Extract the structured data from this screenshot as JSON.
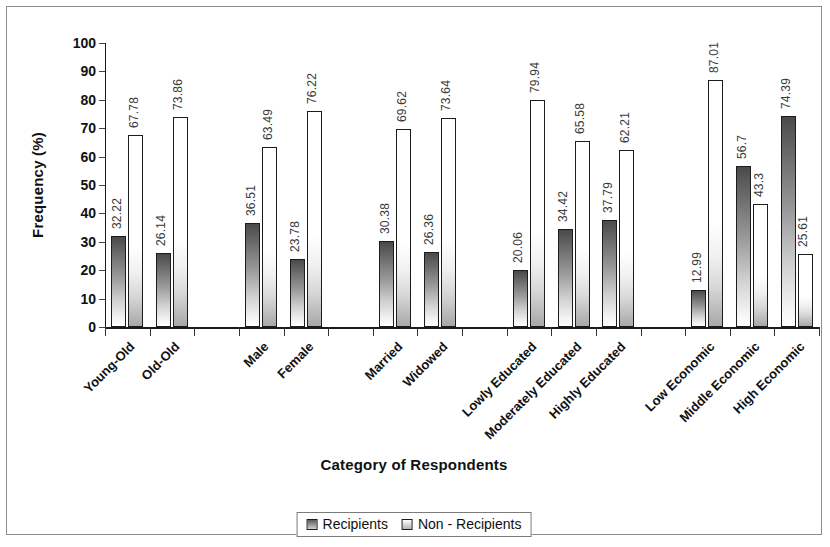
{
  "chart_data": {
    "type": "bar",
    "title": "",
    "xlabel": "Category of Respondents",
    "ylabel": "Frequency (%)",
    "ylim": [
      0,
      100
    ],
    "yticks": [
      0,
      10,
      20,
      30,
      40,
      50,
      60,
      70,
      80,
      90,
      100
    ],
    "grid": false,
    "legend_position": "bottom-center",
    "categories": [
      "Young-Old",
      "Old-Old",
      "",
      "Male",
      "Female",
      "",
      "Married",
      "Widowed",
      "",
      "Lowly Educated",
      "Moderately Educated",
      "Highly Educated",
      "",
      "Low Economic",
      "Middle Economic",
      "High Economic"
    ],
    "series": [
      {
        "name": "Recipients",
        "values": [
          32.22,
          26.14,
          null,
          36.51,
          23.78,
          null,
          30.38,
          26.36,
          null,
          20.06,
          34.42,
          37.79,
          null,
          12.99,
          56.7,
          74.39
        ],
        "labels": [
          "32.22",
          "26.14",
          "",
          "36.51",
          "23.78",
          "",
          "30.38",
          "26.36",
          "",
          "20.06",
          "34.42",
          "37.79",
          "",
          "12.99",
          "56.7",
          "74.39"
        ]
      },
      {
        "name": "Non - Recipients",
        "values": [
          67.78,
          73.86,
          null,
          63.49,
          76.22,
          null,
          69.62,
          73.64,
          null,
          79.94,
          65.58,
          62.21,
          null,
          87.01,
          43.3,
          25.61
        ],
        "labels": [
          "67.78",
          "73.86",
          "",
          "63.49",
          "76.22",
          "",
          "69.62",
          "73.64",
          "",
          "79.94",
          "65.58",
          "62.21",
          "",
          "87.01",
          "43.3",
          "25.61"
        ]
      }
    ]
  },
  "legend": {
    "items": [
      {
        "label": "Recipients",
        "swatch": "recipients-swatch-icon"
      },
      {
        "label": "Non - Recipients",
        "swatch": "non-recipients-swatch-icon"
      }
    ]
  },
  "axis": {
    "y_title": "Frequency (%)",
    "x_title": "Category of Respondents"
  },
  "colors": {
    "axis": "#1a1a1a",
    "frame": "#8c8c8c",
    "recipients_dark": "#4a4a4a",
    "nonrecipients_light": "#ffffff",
    "label_text": "#3a3a3a",
    "text": "#111111"
  }
}
